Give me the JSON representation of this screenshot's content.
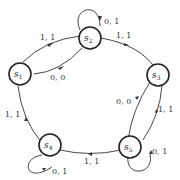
{
  "diagram": {
    "type": "finite-state-machine",
    "states": [
      {
        "id": "s1",
        "label": "s",
        "sub": "1",
        "start": true
      },
      {
        "id": "s2",
        "label": "s",
        "sub": "2"
      },
      {
        "id": "s3",
        "label": "s",
        "sub": "3"
      },
      {
        "id": "s4",
        "label": "s",
        "sub": "4"
      },
      {
        "id": "s5",
        "label": "s",
        "sub": "5"
      }
    ],
    "transitions": [
      {
        "from": "s1",
        "to": "s2",
        "label": "1, 1"
      },
      {
        "from": "s1",
        "to": "s2",
        "label": "0, 0"
      },
      {
        "from": "s2",
        "to": "s2",
        "label": "0, 1"
      },
      {
        "from": "s2",
        "to": "s3",
        "label": "1, 1"
      },
      {
        "from": "s3",
        "to": "s5",
        "label": "1, 1"
      },
      {
        "from": "s5",
        "to": "s3",
        "label": "0, 0"
      },
      {
        "from": "s5",
        "to": "s5",
        "label": "0, 1"
      },
      {
        "from": "s5",
        "to": "s4",
        "label": "1, 1"
      },
      {
        "from": "s4",
        "to": "s4",
        "label": "0, 1"
      },
      {
        "from": "s4",
        "to": "s1",
        "label": "1, 1"
      }
    ]
  }
}
